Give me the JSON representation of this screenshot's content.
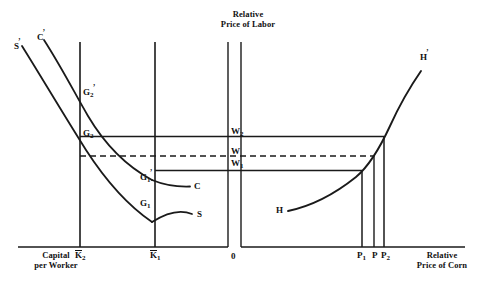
{
  "figure": {
    "title_top": {
      "line1": "Relative",
      "line2": "Price of Labor"
    },
    "axis_bottom_left": {
      "line1": "Capital",
      "line2": "per Worker"
    },
    "axis_bottom_right": {
      "line1": "Relative",
      "line2": "Price of Corn"
    },
    "origin_label": "0"
  },
  "left_panel": {
    "curves": [
      {
        "name": "S-prime",
        "label": "S",
        "prime": true
      },
      {
        "name": "C-prime",
        "label": "C",
        "prime": true
      },
      {
        "name": "C",
        "label": "C",
        "prime": false
      },
      {
        "name": "S",
        "label": "S",
        "prime": false
      }
    ],
    "points": [
      {
        "name": "G2-prime",
        "base": "G",
        "sub": "2",
        "prime": true
      },
      {
        "name": "G2",
        "base": "G",
        "sub": "2",
        "prime": false
      },
      {
        "name": "G1-prime",
        "base": "G",
        "sub": "1",
        "prime": true
      },
      {
        "name": "G1",
        "base": "G",
        "sub": "1",
        "prime": false
      }
    ],
    "x_ticks": [
      {
        "name": "K2",
        "base": "K",
        "sub": "2",
        "bar": true
      },
      {
        "name": "K1",
        "base": "K",
        "sub": "1",
        "bar": true
      }
    ]
  },
  "right_panel": {
    "curves": [
      {
        "name": "H-prime",
        "label": "H",
        "prime": true
      },
      {
        "name": "H",
        "label": "H",
        "prime": false
      }
    ],
    "x_ticks": [
      {
        "name": "P1",
        "base": "P",
        "sub": "1"
      },
      {
        "name": "P",
        "base": "P",
        "sub": ""
      },
      {
        "name": "P2",
        "base": "P",
        "sub": "2"
      }
    ]
  },
  "wage_levels": [
    {
      "name": "W2",
      "base": "W",
      "sub": "2",
      "style": "solid"
    },
    {
      "name": "W",
      "base": "W",
      "sub": "",
      "style": "dashed"
    },
    {
      "name": "W1",
      "base": "W",
      "sub": "1",
      "style": "solid"
    }
  ],
  "colors": {
    "line": "#1a1a1a",
    "text": "#111111",
    "background": "#ffffff"
  }
}
